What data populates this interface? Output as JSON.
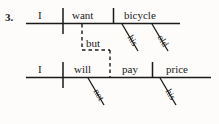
{
  "exercise": {
    "number": "3.",
    "type": "sentence-diagram",
    "style": "Reed-Kellogg"
  },
  "colors": {
    "ink": "#1a1a1a",
    "line": "#1a1a1a",
    "paper": "#fdfcfa"
  },
  "clauses": [
    {
      "id": "clause-1",
      "subject": "I",
      "verb": "want",
      "object": "bicycle",
      "modifiers": [
        {
          "word": "his",
          "attaches_to": "bicycle"
        },
        {
          "word": "old",
          "attaches_to": "bicycle"
        }
      ]
    },
    {
      "id": "clause-2",
      "subject": "I",
      "verb": "will pay",
      "verb_part_1": "will",
      "verb_part_2": "pay",
      "object": "price",
      "modifiers": [
        {
          "word": "not",
          "attaches_to": "will"
        },
        {
          "word": "his",
          "attaches_to": "price"
        }
      ]
    }
  ],
  "conjunction": {
    "word": "but",
    "line_style": "dashed",
    "joins": [
      "clause-1",
      "clause-2"
    ]
  },
  "labels": {
    "number": "3.",
    "c1_subject": "I",
    "c1_verb": "want",
    "c1_object": "bicycle",
    "c1_mod_his": "his",
    "c1_mod_old": "old",
    "conjunction": "but",
    "c2_subject": "I",
    "c2_verb1": "will",
    "c2_verb2": "pay",
    "c2_object": "price",
    "c2_mod_not": "not",
    "c2_mod_his": "his"
  }
}
